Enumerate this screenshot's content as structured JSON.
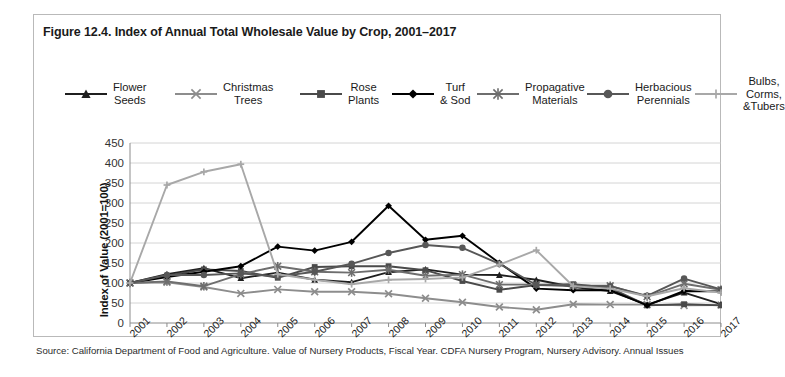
{
  "figure": {
    "title": "Figure 12.4. Index of Annual Total Wholesale Value by Crop, 2001–2017",
    "source": "Source: California Department of Food and Agriculture. Value of Nursery Products, Fiscal Year. CDFA Nursery Program, Nursery Advisory. Annual Issues"
  },
  "axes": {
    "ylabel": "Index of Value (2001=100)",
    "yticks": [
      "450",
      "400",
      "350",
      "300",
      "250",
      "200",
      "150",
      "100",
      "50",
      "0"
    ]
  },
  "legend": {
    "items": [
      {
        "label": "Flower\nSeeds",
        "marker": "triangle",
        "color": "#1f1f1f",
        "icon": "triangle-marker-icon"
      },
      {
        "label": "Christmas\nTrees",
        "marker": "x",
        "color": "#8d8d8d",
        "icon": "x-marker-icon"
      },
      {
        "label": "Rose\nPlants",
        "marker": "square",
        "color": "#4a4a4a",
        "icon": "square-marker-icon"
      },
      {
        "label": "Turf\n& Sod",
        "marker": "diamond",
        "color": "#000000",
        "icon": "diamond-marker-icon"
      },
      {
        "label": "Propagative\nMaterials",
        "marker": "asterisk",
        "color": "#6e6e6e",
        "icon": "asterisk-marker-icon"
      },
      {
        "label": "Herbacious\nPerennials",
        "marker": "circle",
        "color": "#575757",
        "icon": "circle-marker-icon"
      },
      {
        "label": "Bulbs,\nCorms,\n&Tubers",
        "marker": "plus",
        "color": "#a8a8a8",
        "icon": "plus-marker-icon"
      }
    ]
  },
  "chart_data": {
    "type": "line",
    "title": "Figure 12.4. Index of Annual Total Wholesale Value by Crop, 2001–2017",
    "xlabel": "",
    "ylabel": "Index of Value (2001=100)",
    "categories": [
      "2001",
      "2002",
      "2003",
      "2004",
      "2005",
      "2006",
      "2007",
      "2008",
      "2009",
      "2010",
      "2011",
      "2012",
      "2013",
      "2014",
      "2015",
      "2016",
      "2017"
    ],
    "ylim": [
      0,
      450
    ],
    "ytick_step": 50,
    "grid": true,
    "legend_position": "top",
    "series": [
      {
        "name": "Flower Seeds",
        "marker": "triangle",
        "color": "#1f1f1f",
        "values": [
          100,
          122,
          137,
          112,
          126,
          108,
          102,
          127,
          134,
          121,
          120,
          108,
          90,
          80,
          46,
          76,
          47
        ]
      },
      {
        "name": "Christmas Trees",
        "marker": "x",
        "color": "#8d8d8d",
        "values": [
          100,
          102,
          90,
          74,
          84,
          78,
          78,
          73,
          62,
          52,
          40,
          33,
          47,
          46,
          46,
          44,
          45
        ]
      },
      {
        "name": "Rose Plants",
        "marker": "square",
        "color": "#4a4a4a",
        "values": [
          100,
          118,
          134,
          130,
          113,
          140,
          142,
          142,
          132,
          105,
          83,
          95,
          97,
          88,
          44,
          47,
          44
        ]
      },
      {
        "name": "Turf & Sod",
        "marker": "diamond",
        "color": "#000000",
        "values": [
          100,
          115,
          128,
          142,
          191,
          181,
          203,
          293,
          208,
          218,
          150,
          86,
          82,
          82,
          44,
          80,
          79
        ]
      },
      {
        "name": "Propagative Materials",
        "marker": "asterisk",
        "color": "#6e6e6e",
        "values": [
          100,
          104,
          92,
          122,
          142,
          128,
          126,
          133,
          118,
          121,
          96,
          96,
          93,
          93,
          66,
          98,
          83
        ]
      },
      {
        "name": "Herbacious Perennials",
        "marker": "circle",
        "color": "#575757",
        "values": [
          100,
          120,
          120,
          124,
          116,
          128,
          148,
          175,
          195,
          188,
          148,
          95,
          93,
          92,
          68,
          111,
          84
        ]
      },
      {
        "name": "Bulbs, Corms, &Tubers",
        "marker": "plus",
        "color": "#a8a8a8",
        "values": [
          100,
          345,
          378,
          397,
          122,
          108,
          97,
          108,
          110,
          114,
          146,
          182,
          92,
          86,
          67,
          87,
          76
        ]
      }
    ]
  }
}
